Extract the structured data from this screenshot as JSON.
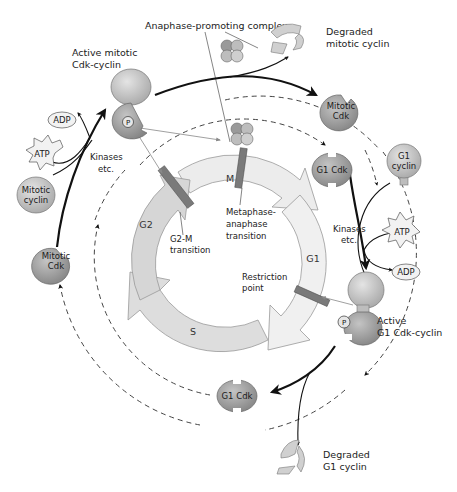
{
  "diagram": {
    "type": "cell-cycle-regulation",
    "colors": {
      "background": "#ffffff",
      "cycle_ring": "#dcdcdc",
      "cycle_ring_light": "#ececec",
      "protein_dark": "#9a9a9a",
      "protein_light": "#bdbdbd",
      "transition_bar": "#7a7a7a",
      "arrow": "#111111",
      "dashed_path": "#444444",
      "thin_arrow": "#888888"
    },
    "phases": {
      "m": "M",
      "g1": "G1",
      "s": "S",
      "g2": "G2"
    },
    "transitions": {
      "g2_m": [
        "G2-M",
        "transition"
      ],
      "metaphase_anaphase": [
        "Metaphase-",
        "anaphase",
        "transition"
      ],
      "restriction_point": [
        "Restriction",
        "point"
      ]
    },
    "labels": {
      "anaphase_promoting_complex": "Anaphase-promoting complex",
      "active_mitotic_cdk_cyclin": [
        "Active mitotic",
        "Cdk-cyclin"
      ],
      "degraded_mitotic_cyclin": [
        "Degraded",
        "mitotic cyclin"
      ],
      "active_g1_cdk_cyclin": [
        "Active",
        "G1 Cdk-cyclin"
      ],
      "degraded_g1_cyclin": [
        "Degraded",
        "G1 cyclin"
      ],
      "kinases_left": [
        "Kinases",
        "etc."
      ],
      "kinases_right": [
        "Kinases",
        "etc."
      ]
    },
    "molecules": {
      "mitotic_cdk_top_right": [
        "Mitotic",
        "Cdk"
      ],
      "g1_cdk_right": "G1 Cdk",
      "g1_cyclin": [
        "G1",
        "cyclin"
      ],
      "atp_right": "ATP",
      "adp_right": "ADP",
      "g1_cdk_bottom": "G1 Cdk",
      "mitotic_cdk_left": [
        "Mitotic",
        "Cdk"
      ],
      "mitotic_cyclin": [
        "Mitotic",
        "cyclin"
      ],
      "atp_left": "ATP",
      "adp_left": "ADP",
      "phosphate": "P"
    }
  }
}
